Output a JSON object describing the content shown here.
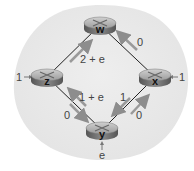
{
  "colors": {
    "background": "#ffffff",
    "blob": "#ececec",
    "link": "#222222",
    "arrow": "#9a9a9a",
    "router_top": "#b5b5b5",
    "router_side": "#6e6e6e"
  },
  "nodes": [
    {
      "id": "w",
      "label": "w",
      "x": 100,
      "y": 25
    },
    {
      "id": "z",
      "label": "z",
      "x": 47,
      "y": 77
    },
    {
      "id": "x",
      "label": "x",
      "x": 155,
      "y": 77
    },
    {
      "id": "y",
      "label": "y",
      "x": 102,
      "y": 130
    }
  ],
  "links": [
    {
      "from": "z",
      "to": "w",
      "load": "2 + e"
    },
    {
      "from": "x",
      "to": "w",
      "load": "0"
    },
    {
      "from": "y",
      "to": "z",
      "load": "1 + e"
    },
    {
      "from": "z",
      "to": "y",
      "load": "0"
    },
    {
      "from": "x",
      "to": "y",
      "load": "1"
    },
    {
      "from": "y",
      "to": "x",
      "load": "0"
    }
  ],
  "external_inputs": [
    {
      "node": "z",
      "label": "1"
    },
    {
      "node": "x",
      "label": "1"
    },
    {
      "node": "y",
      "label": "e"
    }
  ],
  "labels": {
    "zw": "2 + e",
    "xw": "0",
    "yz": "1 + e",
    "zy": "0",
    "xy": "1",
    "yx": "0",
    "z_in": "1",
    "x_in": "1",
    "y_in": "e"
  }
}
